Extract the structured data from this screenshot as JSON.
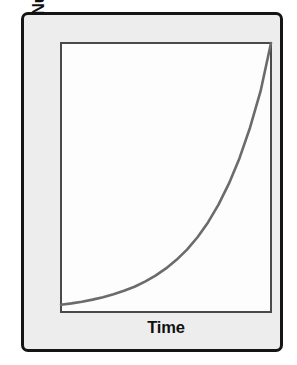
{
  "figure": {
    "kind": "line-chart",
    "background_color": "#ffffff",
    "frame": {
      "fill_color": "#ededed",
      "border_color": "#151515",
      "corner_radius_px": 7
    },
    "plot": {
      "fill_color": "#fdfdfd",
      "border_color": "#4a4a4a"
    }
  },
  "labels": {
    "y_axis_title": "Number of Individuals",
    "x_axis_title": "Time"
  },
  "chart_data": {
    "type": "line",
    "title": "",
    "subtitle": "",
    "xlabel": "Time",
    "ylabel": "Number of Individuals",
    "grid": false,
    "legend": null,
    "legend_position": "none",
    "axis_ticks": {
      "x": [],
      "y": []
    },
    "xlim": [
      0,
      1
    ],
    "ylim": [
      0,
      1
    ],
    "annotations": [],
    "series": [
      {
        "name": "Exponential growth",
        "color": "#6b6b6b",
        "line_width_px": 2.6,
        "curve_model": "y = 0.0265 * exp(3.63 * x)",
        "x": [
          0.0,
          0.05,
          0.1,
          0.15,
          0.2,
          0.25,
          0.3,
          0.35,
          0.4,
          0.45,
          0.5,
          0.55,
          0.6,
          0.65,
          0.7,
          0.75,
          0.8,
          0.85,
          0.9,
          0.95,
          1.0
        ],
        "y": [
          0.027,
          0.032,
          0.038,
          0.046,
          0.055,
          0.066,
          0.079,
          0.094,
          0.113,
          0.135,
          0.162,
          0.194,
          0.232,
          0.278,
          0.333,
          0.399,
          0.478,
          0.572,
          0.685,
          0.82,
          1.0
        ]
      }
    ]
  }
}
